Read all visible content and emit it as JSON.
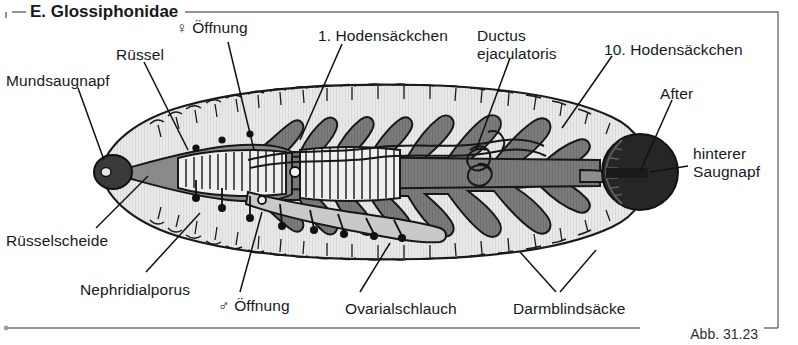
{
  "figure": {
    "section_title": "E. Glossiphonidae",
    "figure_number": "Abb. 31.23",
    "frame_color": "#6e7276",
    "background": "#ffffff"
  },
  "palette": {
    "body_fill": "#e6e6e6",
    "body_outline": "#1a1a1a",
    "gut_dark": "#7b7b7b",
    "gut_outline": "#171717",
    "sucker_dark": "#2b2b2b",
    "posterior_sucker": "#262626",
    "proboscis_fill": "#8a8a8a",
    "ovary_fill": "#c9c9c9",
    "text_color": "#15191c",
    "leader_line": "#111111"
  },
  "labels": [
    {
      "name": "mundsaugnapf",
      "text": "Mundsaugnapf",
      "x": 6,
      "y": 72,
      "align": "left"
    },
    {
      "name": "ruessel",
      "text": "Rüssel",
      "x": 116,
      "y": 46,
      "align": "left"
    },
    {
      "name": "weibliche-oeffnung",
      "text": "♀ Öffnung",
      "x": 176,
      "y": 19,
      "align": "left"
    },
    {
      "name": "erstes-hodensaeckchen",
      "text": "1. Hodensäckchen",
      "x": 318,
      "y": 27,
      "align": "left"
    },
    {
      "name": "ductus-ejaculatoris",
      "text": "Ductus\nejaculatoris",
      "x": 477,
      "y": 27,
      "align": "left"
    },
    {
      "name": "zehntes-hodensaeckchen",
      "text": "10. Hodensäckchen",
      "x": 604,
      "y": 41,
      "align": "left"
    },
    {
      "name": "after",
      "text": "After",
      "x": 660,
      "y": 85,
      "align": "left"
    },
    {
      "name": "hinterer-saugnapf",
      "text": "hinterer\nSaugnapf",
      "x": 693,
      "y": 145,
      "align": "left"
    },
    {
      "name": "ruesselscheide",
      "text": "Rüsselscheide",
      "x": 6,
      "y": 232,
      "align": "left"
    },
    {
      "name": "nephridialporus",
      "text": "Nephridialporus",
      "x": 80,
      "y": 281,
      "align": "left"
    },
    {
      "name": "maennliche-oeffnung",
      "text": "♂ Öffnung",
      "x": 218,
      "y": 297,
      "align": "left"
    },
    {
      "name": "ovarialschlauch",
      "text": "Ovarialschlauch",
      "x": 345,
      "y": 300,
      "align": "left"
    },
    {
      "name": "darmblindsaecke",
      "text": "Darmblindsäcke",
      "x": 513,
      "y": 300,
      "align": "left"
    }
  ],
  "leaders": [
    {
      "name": "leader-mundsaugnapf",
      "points": "78,88 104,160"
    },
    {
      "name": "leader-ruessel",
      "points": "144,62 188,150"
    },
    {
      "name": "leader-weibliche-oeffnung",
      "points": "228,42 254,150"
    },
    {
      "name": "leader-erstes-hodensaeckchen",
      "points": "342,44 300,140"
    },
    {
      "name": "leader-ductus",
      "points": "510,58 476,150"
    },
    {
      "name": "leader-zehntes-hodensaeckchen",
      "points": "612,56 562,128"
    },
    {
      "name": "leader-after",
      "points": "672,100 640,172"
    },
    {
      "name": "leader-hinterer-saugnapf",
      "points": "688,166 650,172"
    },
    {
      "name": "leader-ruesselscheide",
      "points": "96,228 148,176"
    },
    {
      "name": "leader-nephridialporus",
      "points": "146,272 200,213"
    },
    {
      "name": "leader-maennliche-oeffnung",
      "points": "240,292 262,212"
    },
    {
      "name": "leader-ovarialschlauch",
      "points": "360,292 390,243"
    },
    {
      "name": "leader-darmblindsaecke-a",
      "points": "556,292 520,252"
    },
    {
      "name": "leader-darmblindsaecke-b",
      "points": "560,292 596,250"
    }
  ],
  "anatomy": {
    "body_outline_name": "leech-body-outline",
    "oral_sucker_name": "oral-sucker",
    "posterior_sucker_name": "posterior-sucker",
    "proboscis_name": "proboscis",
    "proboscis_sheath_name": "proboscis-sheath",
    "crop_name": "crop-gut",
    "caeca_name": "gut-caeca",
    "ovary_name": "ovarial-tube",
    "ductus_name": "ductus-ejaculatoris-coil",
    "nephridiopore_count": 8,
    "segment_tick_count": 40,
    "testisac_count": 10
  }
}
